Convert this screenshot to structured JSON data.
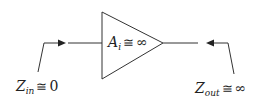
{
  "diagram": {
    "type": "amplifier-block",
    "amplifier": {
      "symbol": "A",
      "subscript": "i",
      "relation": "≅",
      "value": "∞"
    },
    "input": {
      "symbol": "Z",
      "subscript": "in",
      "relation": "≅",
      "value": "0"
    },
    "output": {
      "symbol": "Z",
      "subscript": "out",
      "relation": "≅",
      "value": "∞"
    },
    "colors": {
      "stroke": "#333333",
      "text": "#222222",
      "background": "#ffffff"
    }
  }
}
